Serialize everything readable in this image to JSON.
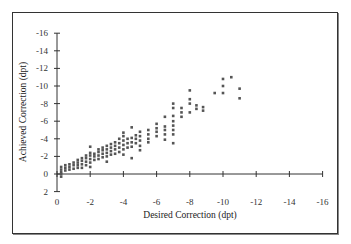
{
  "chart_data": {
    "type": "scatter",
    "title": "",
    "xlabel": "Desired Correction (dpt)",
    "ylabel": "Achieved Correction (dpt)",
    "xlim": [
      0,
      -16
    ],
    "ylim": [
      2,
      -16
    ],
    "x_ticks": [
      "0",
      "-2",
      "-4",
      "-6",
      "-8",
      "-10",
      "-12",
      "-14",
      "-16"
    ],
    "y_ticks": [
      "-16",
      "-14",
      "-12",
      "-10",
      "-8",
      "-6",
      "-4",
      "-2",
      "0",
      "2"
    ],
    "grid": false,
    "legend": null,
    "marker_color": "#555555",
    "series": [
      {
        "name": "measurements",
        "points": [
          [
            -0.25,
            -0.5
          ],
          [
            -0.25,
            0
          ],
          [
            -0.25,
            0.3
          ],
          [
            -0.25,
            -0.2
          ],
          [
            -0.25,
            -0.8
          ],
          [
            -0.5,
            -0.4
          ],
          [
            -0.5,
            -0.7
          ],
          [
            -0.5,
            -1.0
          ],
          [
            -0.75,
            -0.5
          ],
          [
            -0.75,
            -0.8
          ],
          [
            -0.75,
            -1.1
          ],
          [
            -1.0,
            -0.6
          ],
          [
            -1.0,
            -1.0
          ],
          [
            -1.0,
            -1.3
          ],
          [
            -1.25,
            -0.7
          ],
          [
            -1.25,
            -1.0
          ],
          [
            -1.25,
            -1.3
          ],
          [
            -1.25,
            -1.6
          ],
          [
            -1.5,
            -0.7
          ],
          [
            -1.5,
            -1.1
          ],
          [
            -1.5,
            -1.5
          ],
          [
            -1.5,
            -1.8
          ],
          [
            -1.75,
            -1.0
          ],
          [
            -1.75,
            -1.4
          ],
          [
            -1.75,
            -1.8
          ],
          [
            -1.75,
            -2.1
          ],
          [
            -2.0,
            -0.8
          ],
          [
            -2.0,
            -1.3
          ],
          [
            -2.0,
            -1.7
          ],
          [
            -2.0,
            -2.1
          ],
          [
            -2.0,
            -2.4
          ],
          [
            -2.0,
            -3.1
          ],
          [
            -2.25,
            -1.6
          ],
          [
            -2.25,
            -2.0
          ],
          [
            -2.25,
            -2.3
          ],
          [
            -2.5,
            -1.7
          ],
          [
            -2.5,
            -2.1
          ],
          [
            -2.5,
            -2.5
          ],
          [
            -2.5,
            -2.8
          ],
          [
            -2.75,
            -1.9
          ],
          [
            -2.75,
            -2.3
          ],
          [
            -2.75,
            -2.7
          ],
          [
            -2.75,
            -3.0
          ],
          [
            -3.0,
            -1.4
          ],
          [
            -3.0,
            -2.0
          ],
          [
            -3.0,
            -2.4
          ],
          [
            -3.0,
            -2.8
          ],
          [
            -3.0,
            -3.2
          ],
          [
            -3.25,
            -2.2
          ],
          [
            -3.25,
            -2.6
          ],
          [
            -3.25,
            -3.0
          ],
          [
            -3.25,
            -3.4
          ],
          [
            -3.5,
            -2.3
          ],
          [
            -3.5,
            -2.8
          ],
          [
            -3.5,
            -3.2
          ],
          [
            -3.5,
            -3.6
          ],
          [
            -3.75,
            -2.5
          ],
          [
            -3.75,
            -3.0
          ],
          [
            -3.75,
            -3.5
          ],
          [
            -3.75,
            -4.0
          ],
          [
            -4.0,
            -2.2
          ],
          [
            -4.0,
            -2.8
          ],
          [
            -4.0,
            -3.3
          ],
          [
            -4.0,
            -3.8
          ],
          [
            -4.0,
            -4.3
          ],
          [
            -4.0,
            -4.7
          ],
          [
            -4.25,
            -3.0
          ],
          [
            -4.25,
            -3.5
          ],
          [
            -4.25,
            -4.0
          ],
          [
            -4.5,
            -1.8
          ],
          [
            -4.5,
            -3.1
          ],
          [
            -4.5,
            -3.6
          ],
          [
            -4.5,
            -4.1
          ],
          [
            -4.5,
            -5.3
          ],
          [
            -4.75,
            -3.5
          ],
          [
            -4.75,
            -4.0
          ],
          [
            -4.75,
            -4.4
          ],
          [
            -5.0,
            -2.7
          ],
          [
            -5.0,
            -3.2
          ],
          [
            -5.0,
            -3.8
          ],
          [
            -5.0,
            -4.3
          ],
          [
            -5.0,
            -4.8
          ],
          [
            -5.5,
            -3.6
          ],
          [
            -5.5,
            -4.0
          ],
          [
            -5.5,
            -4.5
          ],
          [
            -5.5,
            -5.0
          ],
          [
            -6.0,
            -5.7
          ],
          [
            -6.0,
            -4.3
          ],
          [
            -6.0,
            -4.8
          ],
          [
            -6.0,
            -5.2
          ],
          [
            -6.5,
            -3.9
          ],
          [
            -6.5,
            -4.5
          ],
          [
            -6.5,
            -5.0
          ],
          [
            -6.5,
            -5.4
          ],
          [
            -6.5,
            -6.5
          ],
          [
            -7.0,
            -3.5
          ],
          [
            -7.0,
            -4.5
          ],
          [
            -7.0,
            -5.0
          ],
          [
            -7.0,
            -5.5
          ],
          [
            -7.0,
            -6.0
          ],
          [
            -7.0,
            -6.6
          ],
          [
            -7.0,
            -7.5
          ],
          [
            -7.0,
            -8.0
          ],
          [
            -7.5,
            -6.5
          ],
          [
            -7.5,
            -7.0
          ],
          [
            -7.5,
            -7.5
          ],
          [
            -8.0,
            -8.0
          ],
          [
            -8.0,
            -8.5
          ],
          [
            -8.0,
            -9.5
          ],
          [
            -8.0,
            -7.0
          ],
          [
            -8.4,
            -7.8
          ],
          [
            -8.8,
            -7.6
          ],
          [
            -8.4,
            -7.4
          ],
          [
            -8.8,
            -7.2
          ],
          [
            -9.5,
            -9.2
          ],
          [
            -10.0,
            -9.2
          ],
          [
            -10.0,
            -10.0
          ],
          [
            -10.0,
            -10.8
          ],
          [
            -10.5,
            -11.0
          ],
          [
            -11.0,
            -9.7
          ],
          [
            -11.0,
            -8.6
          ]
        ]
      }
    ]
  }
}
